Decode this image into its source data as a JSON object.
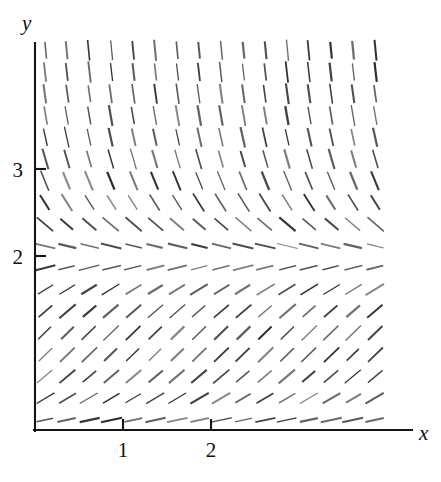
{
  "figure": {
    "kind": "slope-field",
    "background_color": "#ffffff",
    "ink_color": "#2b2b2b",
    "axis_color": "#151515"
  },
  "axes": {
    "x_label": "x",
    "y_label": "y",
    "x_ticks": [
      {
        "value": 1,
        "label": "1"
      },
      {
        "value": 2,
        "label": "2"
      }
    ],
    "y_ticks": [
      {
        "value": 2,
        "label": "2"
      },
      {
        "value": 3,
        "label": "3"
      }
    ],
    "x_origin_px": 35,
    "y_origin_px": 430,
    "x_unit_px": 88,
    "y_unit_px": 87,
    "x_axis_end_px": 412,
    "y_axis_top_px": 43
  },
  "chart_data": {
    "type": "scatter",
    "title": "",
    "xlabel": "x",
    "ylabel": "y",
    "xlim": [
      0,
      4.28
    ],
    "ylim": [
      0,
      4.45
    ],
    "grid": false,
    "legend": null,
    "equation": "dy/dx = y(2 - y)",
    "equilibria": [
      {
        "y": 0,
        "type": "unstable",
        "slope": 0
      },
      {
        "y": 2,
        "type": "stable",
        "slope": 0
      }
    ],
    "grid_cols": 18,
    "grid_rows": 18,
    "x_samples": [
      0.115,
      0.365,
      0.615,
      0.865,
      1.115,
      1.365,
      1.615,
      1.865,
      2.115,
      2.365,
      2.615,
      2.865,
      3.115,
      3.365,
      3.615,
      3.865,
      4.115,
      4.28
    ],
    "y_samples": [
      0.115,
      0.365,
      0.615,
      0.865,
      1.115,
      1.365,
      1.615,
      1.865,
      2.115,
      2.365,
      2.615,
      2.865,
      3.115,
      3.365,
      3.615,
      3.865,
      4.115,
      4.365
    ],
    "slope_by_y": [
      {
        "y": 0.115,
        "slope": 0.22
      },
      {
        "y": 0.365,
        "slope": 0.6
      },
      {
        "y": 0.615,
        "slope": 0.85
      },
      {
        "y": 0.865,
        "slope": 0.98
      },
      {
        "y": 1.115,
        "slope": 0.99
      },
      {
        "y": 1.365,
        "slope": 0.87
      },
      {
        "y": 1.615,
        "slope": 0.62
      },
      {
        "y": 1.865,
        "slope": 0.25
      },
      {
        "y": 2.0,
        "slope": 0.0
      },
      {
        "y": 2.115,
        "slope": -0.24
      },
      {
        "y": 2.365,
        "slope": -0.86
      },
      {
        "y": 2.615,
        "slope": -1.61
      },
      {
        "y": 2.865,
        "slope": -2.48
      },
      {
        "y": 3.115,
        "slope": -3.47
      },
      {
        "y": 3.365,
        "slope": -4.6
      },
      {
        "y": 3.615,
        "slope": -5.84
      },
      {
        "y": 3.865,
        "slope": -7.21
      },
      {
        "y": 4.115,
        "slope": -8.7
      },
      {
        "y": 4.365,
        "slope": -10.3
      }
    ],
    "segment_length_px": 19
  }
}
